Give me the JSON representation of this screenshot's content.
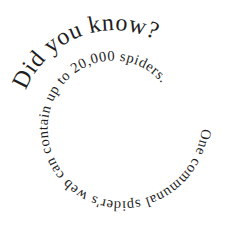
{
  "image": {
    "type": "spiral-text-graphic",
    "background_color": "#ffffff",
    "text_color": "#1e1e1e"
  },
  "spiral": {
    "heading": "Did you know?",
    "body": "One communal spider's web can contain up to 20,000 spiders.",
    "full_text": "Did you know? One communal spider's web can contain up to 20,000 spiders."
  }
}
